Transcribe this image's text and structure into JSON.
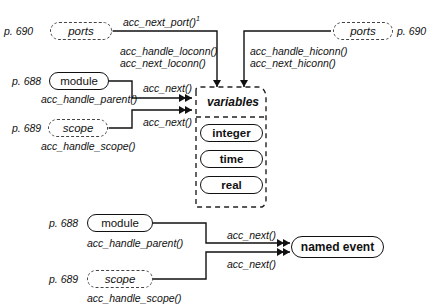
{
  "diagram": {
    "top": {
      "ports_left": {
        "label": "ports",
        "page": "p. 690"
      },
      "ports_right": {
        "label": "ports",
        "page": "p. 690"
      },
      "module": {
        "label": "module",
        "page": "p. 688"
      },
      "scope": {
        "label": "scope",
        "page": "p. 689"
      },
      "variables": {
        "title": "variables",
        "items": [
          "integer",
          "time",
          "real"
        ]
      },
      "labels": {
        "next_port": "acc_next_port()",
        "next_port_sup": "1",
        "handle_loconn": "acc_handle_loconn()",
        "next_loconn": "acc_next_loconn()",
        "handle_hiconn": "acc_handle_hiconn()",
        "next_hiconn": "acc_next_hiconn()",
        "module_next": "acc_next()",
        "handle_parent": "acc_handle_parent()",
        "scope_next": "acc_next()",
        "handle_scope": "acc_handle_scope()"
      }
    },
    "bottom": {
      "module": {
        "label": "module",
        "page": "p. 688"
      },
      "scope": {
        "label": "scope",
        "page": "p. 689"
      },
      "named_event": {
        "label": "named event"
      },
      "labels": {
        "module_next": "acc_next()",
        "handle_parent": "acc_handle_parent()",
        "scope_next": "acc_next()",
        "handle_scope": "acc_handle_scope()"
      }
    }
  }
}
